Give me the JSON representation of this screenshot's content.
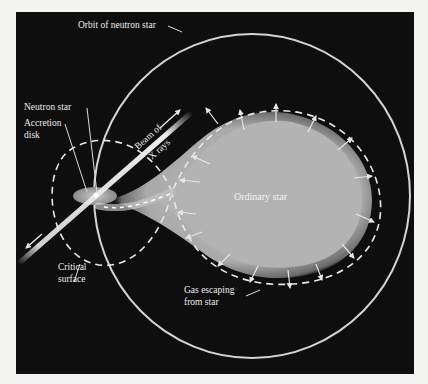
{
  "figure": {
    "background_color": "#0e0e0e",
    "page_color": "#f4f4f2",
    "line_color": "#d8d8d8",
    "star_color": "#b8b8b8",
    "labels": {
      "orbit": "Orbit of neutron star",
      "neutron_star": "Neutron star",
      "accretion_disk_line1": "Accretion",
      "accretion_disk_line2": "disk",
      "beam_line1": "Beam of",
      "beam_line2": "X rays",
      "ordinary_star": "Ordinary star",
      "critical_surface_line1": "Critical",
      "critical_surface_line2": "surface",
      "gas_line1": "Gas escaping",
      "gas_line2": "from star"
    },
    "components": [
      "orbit-of-neutron-star",
      "neutron-star",
      "accretion-disk",
      "x-ray-beam",
      "ordinary-star",
      "critical-surface",
      "gas-stream",
      "escaping-gas-arrows"
    ]
  }
}
